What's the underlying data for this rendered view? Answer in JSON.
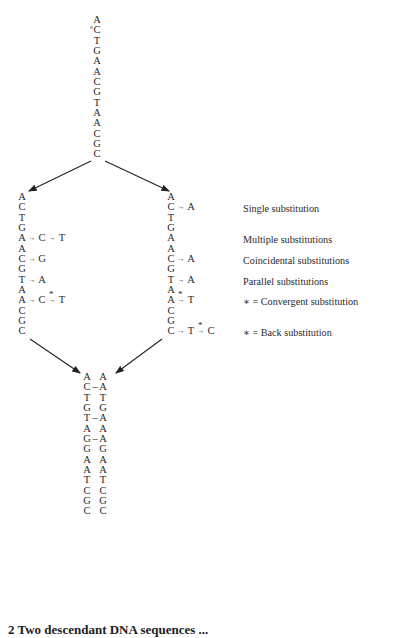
{
  "ancestral_sequence": [
    "A",
    "C",
    "T",
    "G",
    "A",
    "A",
    "C",
    "G",
    "T",
    "A",
    "A",
    "C",
    "G",
    "C"
  ],
  "left_lineage": {
    "rows": [
      {
        "base": "A",
        "changes": []
      },
      {
        "base": "C",
        "changes": []
      },
      {
        "base": "T",
        "changes": []
      },
      {
        "base": "G",
        "changes": []
      },
      {
        "base": "A",
        "changes": [
          "C",
          "T"
        ]
      },
      {
        "base": "A",
        "changes": []
      },
      {
        "base": "C",
        "changes": [
          "G"
        ]
      },
      {
        "base": "G",
        "changes": []
      },
      {
        "base": "T",
        "changes": [
          "A"
        ]
      },
      {
        "base": "A",
        "changes": []
      },
      {
        "base": "A",
        "changes": [
          "C",
          "T"
        ],
        "star_on_change": 2
      },
      {
        "base": "C",
        "changes": []
      },
      {
        "base": "G",
        "changes": []
      },
      {
        "base": "C",
        "changes": []
      }
    ]
  },
  "right_lineage": {
    "rows": [
      {
        "base": "A",
        "changes": []
      },
      {
        "base": "C",
        "changes": [
          "A"
        ]
      },
      {
        "base": "T",
        "changes": []
      },
      {
        "base": "G",
        "changes": []
      },
      {
        "base": "A",
        "changes": []
      },
      {
        "base": "A",
        "changes": []
      },
      {
        "base": "C",
        "changes": [
          "A"
        ]
      },
      {
        "base": "G",
        "changes": []
      },
      {
        "base": "T",
        "changes": [
          "A"
        ]
      },
      {
        "base": "A",
        "changes": []
      },
      {
        "base": "A",
        "changes": [
          "T"
        ],
        "star_on_change": 1
      },
      {
        "base": "C",
        "changes": []
      },
      {
        "base": "G",
        "changes": []
      },
      {
        "base": "C",
        "changes": [
          "T",
          "C"
        ],
        "star_on_change": 2
      }
    ]
  },
  "legend": {
    "single": "Single substitution",
    "multiple": "Multiple substitutions",
    "coincidental": "Coincidental substitutions",
    "parallel": "Parallel substitutions",
    "convergent": "∗ = Convergent substitution",
    "back": "∗ = Back substitution"
  },
  "symbols": {
    "arrow": "→",
    "star": "*",
    "bond": "—"
  },
  "descendant_comparison": {
    "left": [
      "A",
      "C",
      "T",
      "G",
      "T",
      "A",
      "G",
      "G",
      "A",
      "A",
      "T",
      "C",
      "G",
      "C"
    ],
    "right": [
      "A",
      "A",
      "T",
      "G",
      "A",
      "A",
      "A",
      "G",
      "A",
      "A",
      "T",
      "C",
      "G",
      "C"
    ],
    "differences": [
      false,
      true,
      false,
      false,
      true,
      false,
      true,
      false,
      false,
      false,
      false,
      false,
      false,
      false
    ]
  },
  "caption": "2 Two descendant DNA sequences ..."
}
